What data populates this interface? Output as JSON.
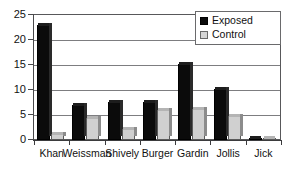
{
  "chart_data": {
    "type": "bar",
    "title": "",
    "subtitle": "",
    "xlabel": "",
    "ylabel": "",
    "categories": [
      "Khan",
      "Weissman",
      "Shively",
      "Burger",
      "Gardin",
      "Jollis",
      "Jick"
    ],
    "series": [
      {
        "name": "Exposed",
        "color": "#0b0b0b",
        "values": [
          23.0,
          7.0,
          7.7,
          7.7,
          15.2,
          10.3,
          0.1
        ]
      },
      {
        "name": "Control",
        "color": "#d0d0d0",
        "values": [
          1.3,
          4.5,
          2.2,
          6.1,
          6.2,
          4.8,
          0.1
        ]
      }
    ],
    "ylim": [
      0,
      25
    ],
    "ytick_values": [
      0,
      5,
      10,
      15,
      20,
      25
    ],
    "ytick_labels": [
      "0",
      "5",
      "10",
      "15",
      "20",
      "25"
    ],
    "grid": true,
    "grid_axis": "y",
    "legend_position": "top-right",
    "legend_entries": [
      "Exposed",
      "Control"
    ]
  },
  "legend": {
    "items": [
      {
        "label": "Exposed",
        "swatch": "black-square-icon"
      },
      {
        "label": "Control",
        "swatch": "gray-square-icon"
      }
    ]
  },
  "axes": {
    "y_ticks": [
      "0",
      "5",
      "10",
      "15",
      "20",
      "25"
    ],
    "x_ticks": [
      "Khan",
      "Weissman",
      "Shively",
      "Burger",
      "Gardin",
      "Jollis",
      "Jick"
    ]
  }
}
